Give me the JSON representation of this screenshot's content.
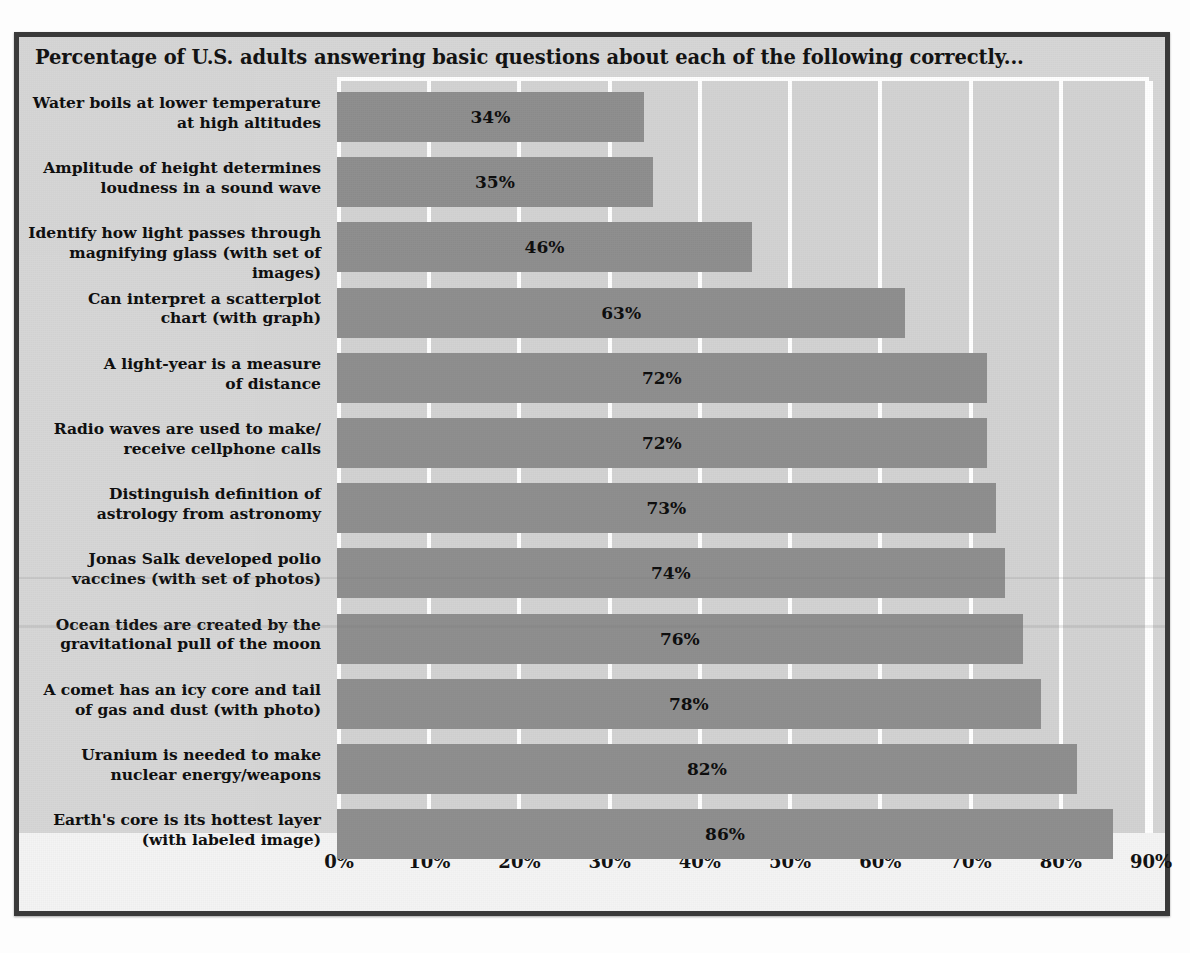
{
  "chart_title": "Percentage of U.S. adults answering basic questions about each of the following correctly...",
  "chart_data": {
    "type": "bar",
    "orientation": "horizontal",
    "title": "Percentage of U.S. adults answering basic questions about each of the following correctly...",
    "xlabel": "",
    "ylabel": "",
    "xlim": [
      0,
      90
    ],
    "grid": true,
    "legend": false,
    "value_suffix": "%",
    "tick_labels": [
      "0%",
      "10%",
      "20%",
      "30%",
      "40%",
      "50%",
      "60%",
      "70%",
      "80%",
      "90%"
    ],
    "ticks": [
      0,
      10,
      20,
      30,
      40,
      50,
      60,
      70,
      80,
      90
    ],
    "categories": [
      "Water boils at lower temperature\nat high altitudes",
      "Amplitude of height determines\nloudness in a sound wave",
      "Identify how light passes through\nmagnifying glass (with set of images)",
      "Can interpret a scatterplot\nchart (with graph)",
      "A light-year is a measure\nof distance",
      "Radio waves are used to make/\nreceive cellphone calls",
      "Distinguish definition of\nastrology from astronomy",
      "Jonas Salk developed polio\nvaccines (with set of photos)",
      "Ocean tides are created by the\ngravitational pull of the moon",
      "A comet has an icy core and tail\nof gas and dust (with photo)",
      "Uranium is needed to make\nnuclear energy/weapons",
      "Earth's core is its hottest layer\n(with labeled image)"
    ],
    "values": [
      34,
      35,
      46,
      63,
      72,
      72,
      73,
      74,
      76,
      78,
      82,
      86
    ],
    "value_labels": [
      "34%",
      "35%",
      "46%",
      "63%",
      "72%",
      "72%",
      "73%",
      "74%",
      "76%",
      "78%",
      "82%",
      "86%"
    ]
  },
  "colors": {
    "bar": "#8e8e8e",
    "plot_background": "#d2d2d2",
    "gridline": "#ffffff",
    "frame": "#3a3a3a",
    "text": "#0d0d0d"
  }
}
